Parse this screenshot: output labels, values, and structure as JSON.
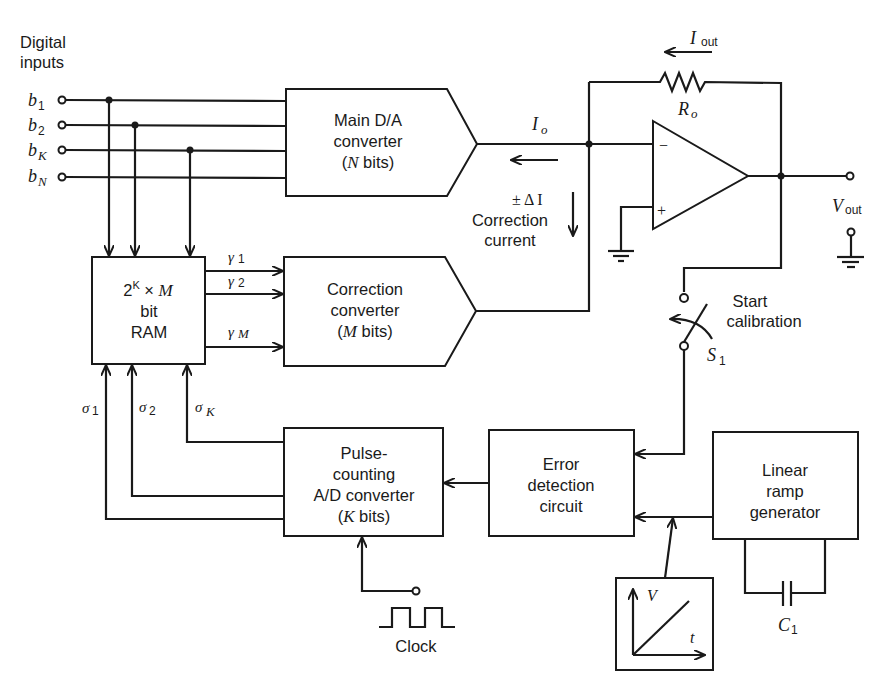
{
  "inputs": {
    "heading_line1": "Digital",
    "heading_line2": "inputs",
    "bits": [
      {
        "sym": "b",
        "sub": "1"
      },
      {
        "sym": "b",
        "sub": "2"
      },
      {
        "sym": "b",
        "sub": "K"
      },
      {
        "sym": "b",
        "sub": "N"
      }
    ]
  },
  "blocks": {
    "main_dac": {
      "line1": "Main D/A",
      "line2": "converter",
      "line3_var": "N",
      "line3_rest": " bits)",
      "line3_open": "("
    },
    "ram": {
      "line1_base": "2",
      "line1_exp": "K",
      "line1_times": " × ",
      "line1_var": "M",
      "line2": "bit",
      "line3": "RAM"
    },
    "correction": {
      "line1": "Correction",
      "line2": "converter",
      "line3_open": "(",
      "line3_var": "M",
      "line3_rest": " bits)"
    },
    "adc": {
      "line1": "Pulse-",
      "line2": "counting",
      "line3": "A/D converter",
      "line4_open": "(",
      "line4_var": "K",
      "line4_rest": " bits)"
    },
    "error": {
      "line1": "Error",
      "line2": "detection",
      "line3": "circuit"
    },
    "ramp": {
      "line1": "Linear",
      "line2": "ramp",
      "line3": "generator"
    }
  },
  "signals": {
    "gamma": [
      {
        "sym": "γ",
        "sub": "1"
      },
      {
        "sym": "γ",
        "sub": "2"
      },
      {
        "sym": "γ",
        "sub": "M"
      }
    ],
    "sigma": [
      {
        "sym": "σ",
        "sub": "1"
      },
      {
        "sym": "σ",
        "sub": "2"
      },
      {
        "sym": "σ",
        "sub": "K"
      }
    ],
    "io": {
      "sym": "I",
      "sub": "o"
    },
    "delta_i": "± Δ I",
    "correction_current_line1": "Correction",
    "correction_current_line2": "current",
    "iout": {
      "sym": "I",
      "sub": "out"
    },
    "ro": {
      "sym": "R",
      "sub": "o"
    },
    "vout": {
      "sym": "V",
      "sub": "out"
    },
    "opamp_minus": "−",
    "opamp_plus": "+",
    "switch": {
      "sym": "S",
      "sub": "1"
    },
    "start_cal_line1": "Start",
    "start_cal_line2": "calibration",
    "clock": "Clock",
    "cap": {
      "sym": "C",
      "sub": "1"
    },
    "ramp_graph": {
      "y_axis": "V",
      "x_axis": "t"
    }
  }
}
